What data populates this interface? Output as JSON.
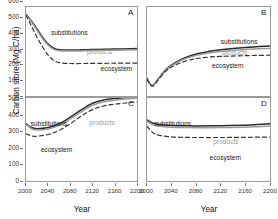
{
  "figure": {
    "ylabel": "Carbon store (Mg C/ha)",
    "xlabel": "Year"
  },
  "axes": {
    "xticks": [
      "2000",
      "2040",
      "2080",
      "2120",
      "2160",
      "2200"
    ],
    "xtick_values": [
      2000,
      2040,
      2080,
      2120,
      2160,
      2200
    ],
    "yticks_top": [
      "600",
      "500",
      "400",
      "300",
      "200",
      "100",
      "0"
    ],
    "yticks_bottom": [
      "500",
      "400",
      "300",
      "200",
      "100",
      "0"
    ],
    "xlim": [
      2000,
      2200
    ],
    "ylim_top": [
      0,
      600
    ],
    "ylim_bottom": [
      0,
      500
    ]
  },
  "panels": [
    {
      "id": "A",
      "label": "A"
    },
    {
      "id": "B",
      "label": "B"
    },
    {
      "id": "C",
      "label": "C"
    },
    {
      "id": "D",
      "label": "D"
    }
  ],
  "series_labels": {
    "substitutions": "substitutions",
    "products": "products",
    "ecosystem": "ecosystem"
  },
  "colors": {
    "substitutions": "#2b2b2b",
    "products": "#9b9b9b",
    "ecosystem": "#333333",
    "axis": "#9a9a9a",
    "background": "#ffffff"
  },
  "chart_data": {
    "type": "line",
    "title": "",
    "xlabel": "Year",
    "ylabel": "Carbon store (Mg C/ha)",
    "grid": false,
    "legend": "inline-annotations",
    "panels": [
      {
        "panel": "A",
        "xlim": [
          2000,
          2200
        ],
        "ylim": [
          0,
          600
        ],
        "x": [
          2000,
          2010,
          2020,
          2030,
          2040,
          2050,
          2060,
          2080,
          2100,
          2120,
          2160,
          2200
        ],
        "series": [
          {
            "name": "substitutions",
            "style": "solid-dark",
            "values": [
              550,
              505,
              450,
              395,
              350,
              322,
              312,
              310,
              311,
              313,
              316,
              320
            ]
          },
          {
            "name": "products",
            "style": "solid-gray",
            "values": [
              548,
              498,
              442,
              386,
              342,
              314,
              305,
              303,
              304,
              306,
              309,
              312
            ]
          },
          {
            "name": "ecosystem",
            "style": "dashed",
            "values": [
              545,
              470,
              395,
              330,
              275,
              240,
              225,
              219,
              219,
              220,
              221,
              222
            ]
          }
        ]
      },
      {
        "panel": "B",
        "xlim": [
          2000,
          2200
        ],
        "ylim": [
          0,
          600
        ],
        "x": [
          2000,
          2005,
          2010,
          2020,
          2030,
          2040,
          2060,
          2080,
          2100,
          2120,
          2160,
          2200
        ],
        "series": [
          {
            "name": "substitutions",
            "style": "solid-dark",
            "values": [
              120,
              82,
              72,
              125,
              175,
              210,
              255,
              283,
              300,
              312,
              327,
              337
            ]
          },
          {
            "name": "products",
            "style": "solid-gray",
            "values": [
              118,
              80,
              70,
              122,
              171,
              205,
              248,
              274,
              290,
              300,
              313,
              321
            ]
          },
          {
            "name": "ecosystem",
            "style": "dashed",
            "values": [
              115,
              78,
              68,
              118,
              165,
              196,
              232,
              252,
              262,
              267,
              272,
              275
            ]
          }
        ]
      },
      {
        "panel": "C",
        "xlim": [
          2000,
          2200
        ],
        "ylim": [
          0,
          500
        ],
        "x": [
          2000,
          2010,
          2020,
          2040,
          2060,
          2080,
          2100,
          2120,
          2140,
          2160,
          2180,
          2200
        ],
        "series": [
          {
            "name": "substitutions",
            "style": "solid-dark",
            "values": [
              345,
              322,
              315,
              322,
              345,
              385,
              430,
              468,
              488,
              497,
              503,
              508
            ]
          },
          {
            "name": "products",
            "style": "solid-gray",
            "values": [
              340,
              315,
              307,
              313,
              335,
              374,
              418,
              456,
              477,
              487,
              494,
              499
            ]
          },
          {
            "name": "ecosystem",
            "style": "dashed",
            "values": [
              285,
              272,
              270,
              280,
              305,
              345,
              392,
              430,
              452,
              463,
              470,
              476
            ]
          }
        ]
      },
      {
        "panel": "D",
        "xlim": [
          2000,
          2200
        ],
        "ylim": [
          0,
          500
        ],
        "x": [
          2000,
          2010,
          2020,
          2040,
          2060,
          2080,
          2120,
          2160,
          2180,
          2200
        ],
        "series": [
          {
            "name": "substitutions",
            "style": "solid-dark",
            "values": [
              368,
              348,
              340,
              335,
              333,
              332,
              333,
              336,
              340,
              345
            ]
          },
          {
            "name": "products",
            "style": "solid-gray",
            "values": [
              360,
              338,
              330,
              324,
              322,
              321,
              322,
              324,
              327,
              331
            ]
          },
          {
            "name": "ecosystem",
            "style": "dashed",
            "values": [
              330,
              290,
              275,
              266,
              263,
              262,
              262,
              263,
              264,
              265
            ]
          }
        ]
      }
    ]
  }
}
